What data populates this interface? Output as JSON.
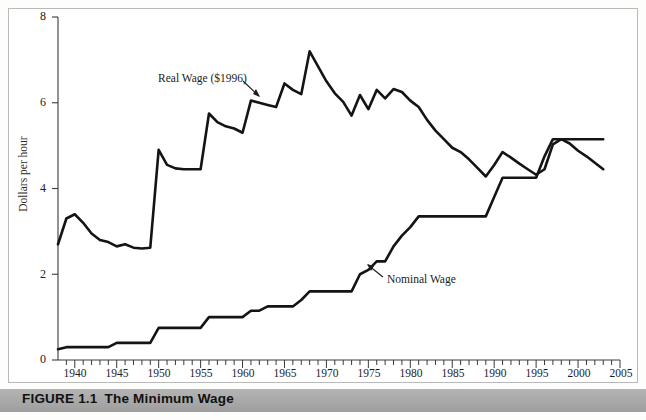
{
  "figure": {
    "caption_number": "FIGURE 1.1",
    "caption_title": "The Minimum Wage"
  },
  "axes": {
    "ylabel": "Dollars per hour",
    "ytick_labels": [
      "8",
      "6",
      "4",
      "2",
      "0"
    ],
    "xtick_labels": [
      "1940",
      "1945",
      "1950",
      "1955",
      "1960",
      "1965",
      "1970",
      "1975",
      "1980",
      "1985",
      "1990",
      "1995",
      "2000",
      "2005"
    ]
  },
  "annotations": {
    "real_wage_label": "Real Wage ($1996)",
    "nominal_wage_label": "Nominal Wage"
  },
  "chart_data": {
    "type": "line",
    "title": "The Minimum Wage",
    "xlabel": "",
    "ylabel": "Dollars per hour",
    "xlim": [
      1938,
      2005
    ],
    "ylim": [
      0,
      8
    ],
    "grid": false,
    "legend": "annotated-inline",
    "x": [
      1938,
      1939,
      1940,
      1941,
      1942,
      1943,
      1944,
      1945,
      1946,
      1947,
      1948,
      1949,
      1950,
      1951,
      1952,
      1953,
      1954,
      1955,
      1956,
      1957,
      1958,
      1959,
      1960,
      1961,
      1962,
      1963,
      1964,
      1965,
      1966,
      1967,
      1968,
      1969,
      1970,
      1971,
      1972,
      1973,
      1974,
      1975,
      1976,
      1977,
      1978,
      1979,
      1980,
      1981,
      1982,
      1983,
      1984,
      1985,
      1986,
      1987,
      1988,
      1989,
      1990,
      1991,
      1992,
      1993,
      1994,
      1995,
      1996,
      1997,
      1998,
      1999,
      2000,
      2001,
      2002,
      2003
    ],
    "series": [
      {
        "name": "Real Wage ($1996)",
        "units": "1996 dollars per hour",
        "values": [
          2.7,
          3.3,
          3.4,
          3.2,
          2.95,
          2.8,
          2.75,
          2.65,
          2.7,
          2.62,
          2.6,
          2.62,
          4.9,
          4.55,
          4.47,
          4.45,
          4.45,
          4.45,
          5.75,
          5.55,
          5.45,
          5.4,
          5.3,
          6.05,
          6.0,
          5.95,
          5.9,
          6.45,
          6.3,
          6.2,
          7.2,
          6.85,
          6.5,
          6.22,
          6.02,
          5.7,
          6.18,
          5.85,
          6.3,
          6.1,
          6.32,
          6.25,
          6.05,
          5.9,
          5.6,
          5.35,
          5.15,
          4.95,
          4.85,
          4.68,
          4.48,
          4.28,
          4.55,
          4.85,
          4.72,
          4.58,
          4.45,
          4.32,
          4.45,
          5.03,
          5.15,
          5.05,
          4.88,
          4.75,
          4.6,
          4.45
        ]
      },
      {
        "name": "Nominal Wage",
        "units": "current dollars per hour",
        "values": [
          0.25,
          0.3,
          0.3,
          0.3,
          0.3,
          0.3,
          0.3,
          0.4,
          0.4,
          0.4,
          0.4,
          0.4,
          0.75,
          0.75,
          0.75,
          0.75,
          0.75,
          0.75,
          1.0,
          1.0,
          1.0,
          1.0,
          1.0,
          1.15,
          1.15,
          1.25,
          1.25,
          1.25,
          1.25,
          1.4,
          1.6,
          1.6,
          1.6,
          1.6,
          1.6,
          1.6,
          2.0,
          2.1,
          2.3,
          2.3,
          2.65,
          2.9,
          3.1,
          3.35,
          3.35,
          3.35,
          3.35,
          3.35,
          3.35,
          3.35,
          3.35,
          3.35,
          3.8,
          4.25,
          4.25,
          4.25,
          4.25,
          4.25,
          4.75,
          5.15,
          5.15,
          5.15,
          5.15,
          5.15,
          5.15,
          5.15
        ]
      }
    ]
  }
}
